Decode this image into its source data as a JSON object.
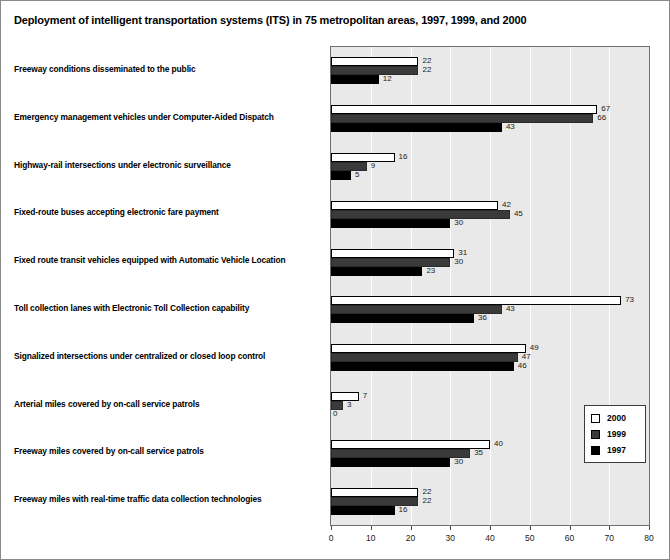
{
  "chart_data": {
    "type": "bar",
    "orientation": "horizontal",
    "title": "Deployment of intelligent transportation systems (ITS) in 75 metropolitan areas, 1997, 1999, and 2000",
    "xlabel": "",
    "ylabel": "",
    "xlim": [
      0,
      80
    ],
    "xticks": [
      0,
      10,
      20,
      30,
      40,
      50,
      60,
      70,
      80
    ],
    "grid": "vertical",
    "legend_position": "lower-right-inside",
    "categories": [
      "Freeway conditions disseminated to the public",
      "Emergency management vehicles under Computer-Aided Dispatch",
      "Highway-rail intersections under electronic surveillance",
      "Fixed-route buses accepting electronic fare payment",
      "Fixed route transit vehicles equipped with Automatic Vehicle Location",
      "Toll collection lanes with Electronic Toll Collection capability",
      "Signalized intersections under centralized or closed loop control",
      "Arterial miles covered by on-call service patrols",
      "Freeway miles covered by on-call service patrols",
      "Freeway miles with real-time traffic data collection technologies"
    ],
    "series": [
      {
        "name": "2000",
        "color": "#ffffff",
        "values": [
          22,
          67,
          16,
          42,
          31,
          73,
          49,
          7,
          40,
          22
        ]
      },
      {
        "name": "1999",
        "color": "#3a3a3a",
        "values": [
          22,
          66,
          9,
          45,
          30,
          43,
          47,
          3,
          35,
          22
        ]
      },
      {
        "name": "1997",
        "color": "#000000",
        "values": [
          12,
          43,
          5,
          30,
          23,
          36,
          46,
          0,
          30,
          16
        ]
      }
    ]
  },
  "legend": {
    "entries": [
      {
        "label": "2000"
      },
      {
        "label": "1999"
      },
      {
        "label": "1997"
      }
    ]
  }
}
